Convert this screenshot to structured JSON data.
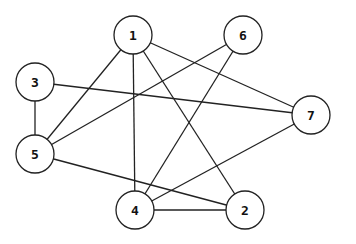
{
  "graph": {
    "stroke_color": "#222222",
    "node_radius": 19,
    "nodes": [
      {
        "id": "1",
        "label": "1",
        "x": 133,
        "y": 35
      },
      {
        "id": "2",
        "label": "2",
        "x": 245,
        "y": 210
      },
      {
        "id": "3",
        "label": "3",
        "x": 35,
        "y": 82
      },
      {
        "id": "4",
        "label": "4",
        "x": 135,
        "y": 210
      },
      {
        "id": "5",
        "label": "5",
        "x": 35,
        "y": 154
      },
      {
        "id": "6",
        "label": "6",
        "x": 243,
        "y": 35
      },
      {
        "id": "7",
        "label": "7",
        "x": 311,
        "y": 115
      }
    ],
    "edges": [
      {
        "from": "1",
        "to": "5"
      },
      {
        "from": "1",
        "to": "4"
      },
      {
        "from": "1",
        "to": "2"
      },
      {
        "from": "1",
        "to": "7"
      },
      {
        "from": "6",
        "to": "5"
      },
      {
        "from": "6",
        "to": "4"
      },
      {
        "from": "3",
        "to": "7"
      },
      {
        "from": "3",
        "to": "5"
      },
      {
        "from": "5",
        "to": "2"
      },
      {
        "from": "4",
        "to": "7"
      },
      {
        "from": "4",
        "to": "2"
      }
    ]
  }
}
